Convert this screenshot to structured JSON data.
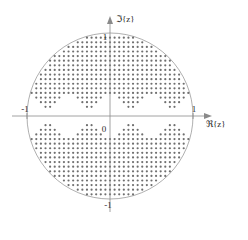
{
  "figure": {
    "title": "",
    "axes": {
      "x_label": "ℜ{z}",
      "y_label": "ℑ{z}",
      "origin_label": "0",
      "x_tick_left": "-1",
      "x_tick_right": "1",
      "y_tick_top": "1",
      "y_tick_bottom": "-1"
    },
    "colors": {
      "axis": "#8a8a8a",
      "circle": "#9a9a9a",
      "dot": "#6f6f6f",
      "text": "#2b2b2b",
      "background": "#ffffff"
    }
  },
  "chart_data": {
    "type": "scatter",
    "title": "",
    "xlabel": "ℜ{z}",
    "ylabel": "ℑ{z}",
    "xlim": [
      -1.35,
      1.35
    ],
    "ylim": [
      -1.3,
      1.3
    ],
    "grid": false,
    "legend": null,
    "xticks": [
      -1,
      0,
      1
    ],
    "xticklabels": [
      "-1",
      "0",
      "1"
    ],
    "yticks": [
      -1,
      1
    ],
    "yticklabels": [
      "-1",
      "1"
    ],
    "annotations": [
      {
        "text": "unit circle",
        "type": "boundary",
        "radius": 1.0,
        "center": [
          0,
          0
        ]
      }
    ],
    "marker": {
      "shape": "dot",
      "size": 1.1,
      "color": "#6f6f6f"
    },
    "sampling": {
      "grid_step": 0.0555,
      "x_range": [
        -1.0,
        1.0
      ],
      "y_range": [
        -1.0,
        1.0
      ],
      "inside_radius": 1.0,
      "exclusion": {
        "kind": "scalloped-band-about-real-axis",
        "base_half_width": 0.085,
        "scallop_amplitude": 0.155,
        "scallop_periods": 4
      }
    }
  }
}
